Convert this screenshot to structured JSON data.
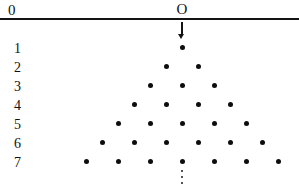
{
  "figure": {
    "type": "lattice-diagram",
    "width": 299,
    "height": 192,
    "background_color": "#ffffff",
    "ink_color": "#111111"
  },
  "axis": {
    "line": {
      "y": 18,
      "x_start": 0,
      "x_end": 299,
      "thickness": 2,
      "color": "#141414"
    },
    "left_label": {
      "text": "0",
      "x": 8,
      "y": 3
    },
    "origin_label": {
      "text": "O",
      "x": 182,
      "y": 2
    }
  },
  "arrow": {
    "name": "downward-arrow",
    "x": 182,
    "y_start": 22,
    "y_end": 39,
    "color": "#141414"
  },
  "row_labels": [
    {
      "text": "1",
      "y": 42
    },
    {
      "text": "2",
      "y": 61
    },
    {
      "text": "3",
      "y": 80
    },
    {
      "text": "4",
      "y": 99
    },
    {
      "text": "5",
      "y": 118
    },
    {
      "text": "6",
      "y": 137
    },
    {
      "text": "7",
      "y": 156
    }
  ],
  "lattice": {
    "center_x": 182,
    "x_spacing": 32,
    "row_y": [
      47,
      66,
      85,
      104,
      123,
      142,
      161
    ],
    "dot_radius": 2.5,
    "dot_color": "#0d0d0d",
    "rows": [
      {
        "row": 1,
        "count": 1,
        "offsets": [
          0
        ]
      },
      {
        "row": 2,
        "count": 2,
        "offsets": [
          -1,
          1
        ]
      },
      {
        "row": 3,
        "count": 3,
        "offsets": [
          -2,
          0,
          2
        ]
      },
      {
        "row": 4,
        "count": 4,
        "offsets": [
          -3,
          -1,
          1,
          3
        ]
      },
      {
        "row": 5,
        "count": 5,
        "offsets": [
          -4,
          -2,
          0,
          2,
          4
        ]
      },
      {
        "row": 6,
        "count": 6,
        "offsets": [
          -5,
          -3,
          -1,
          1,
          3,
          5
        ]
      },
      {
        "row": 7,
        "count": 7,
        "offsets": [
          -6,
          -4,
          -2,
          0,
          2,
          4,
          6
        ]
      }
    ]
  },
  "ellipsis": {
    "name": "vertical-ellipsis",
    "x": 182,
    "dots_y": [
      170,
      176,
      182
    ],
    "color": "#1a1a1a"
  }
}
